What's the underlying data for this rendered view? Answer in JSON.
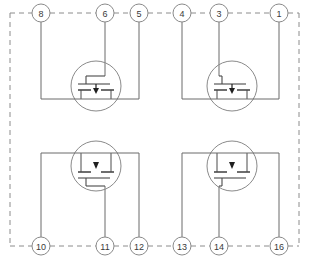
{
  "diagram": {
    "type": "schematic",
    "package_outline": {
      "style": "dashed",
      "color": "#8c8c8c"
    },
    "colors": {
      "wire": "#6b6b6b",
      "device_outline": "#8a8a8a",
      "device_symbol": "#4a4a4a",
      "pin_circle": "#8a8a8a",
      "pin_text": "#3a3a3a",
      "background": "#ffffff"
    },
    "pins": [
      {
        "id": "pin-8",
        "label": "8",
        "cx": 41,
        "cy": 13,
        "row": "top"
      },
      {
        "id": "pin-6",
        "label": "6",
        "cx": 105,
        "cy": 13,
        "row": "top"
      },
      {
        "id": "pin-5",
        "label": "5",
        "cx": 139,
        "cy": 13,
        "row": "top"
      },
      {
        "id": "pin-4",
        "label": "4",
        "cx": 182,
        "cy": 13,
        "row": "top"
      },
      {
        "id": "pin-3",
        "label": "3",
        "cx": 219,
        "cy": 13,
        "row": "top"
      },
      {
        "id": "pin-1",
        "label": "1",
        "cx": 279,
        "cy": 13,
        "row": "top"
      },
      {
        "id": "pin-10",
        "label": "10",
        "cx": 41,
        "cy": 246,
        "row": "bottom"
      },
      {
        "id": "pin-11",
        "label": "11",
        "cx": 105,
        "cy": 246,
        "row": "bottom"
      },
      {
        "id": "pin-12",
        "label": "12",
        "cx": 139,
        "cy": 246,
        "row": "bottom"
      },
      {
        "id": "pin-13",
        "label": "13",
        "cx": 182,
        "cy": 246,
        "row": "bottom"
      },
      {
        "id": "pin-14",
        "label": "14",
        "cx": 219,
        "cy": 246,
        "row": "bottom"
      },
      {
        "id": "pin-16",
        "label": "16",
        "cx": 279,
        "cy": 246,
        "row": "bottom"
      }
    ],
    "transistors": [
      {
        "id": "transistor-top-left",
        "name": "mosfet-top-left",
        "cx": 96,
        "cy": 86,
        "r": 25,
        "orientation": "gate-above",
        "gate_pin": "6",
        "channel_pins": [
          "8",
          "5"
        ]
      },
      {
        "id": "transistor-top-right",
        "name": "mosfet-top-right",
        "cx": 232,
        "cy": 86,
        "r": 25,
        "orientation": "gate-above",
        "gate_pin": "3",
        "channel_pins": [
          "4",
          "1"
        ]
      },
      {
        "id": "transistor-bottom-left",
        "name": "mosfet-bottom-left",
        "cx": 96,
        "cy": 166,
        "r": 25,
        "orientation": "gate-below",
        "gate_pin": "11",
        "channel_pins": [
          "10",
          "12"
        ]
      },
      {
        "id": "transistor-bottom-right",
        "name": "mosfet-bottom-right",
        "cx": 232,
        "cy": 166,
        "r": 25,
        "orientation": "gate-below",
        "gate_pin": "14",
        "channel_pins": [
          "13",
          "16"
        ]
      }
    ]
  }
}
